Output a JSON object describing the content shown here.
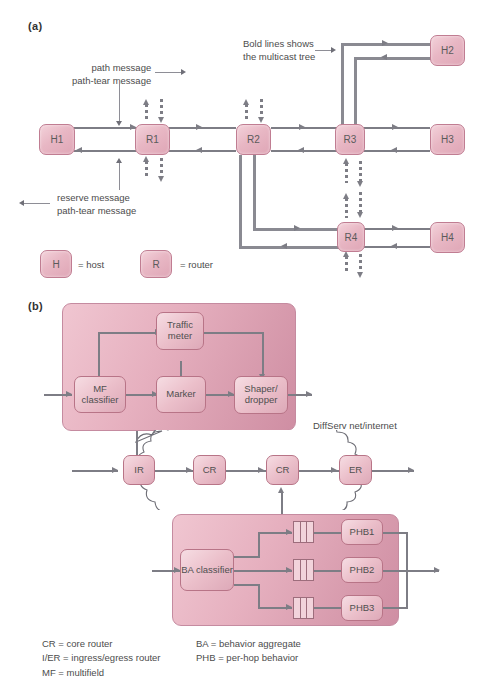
{
  "figure": {
    "panel_a_label": "(a)",
    "panel_b_label": "(b)"
  },
  "panel_a": {
    "nodes": [
      {
        "id": "H1",
        "label": "H1"
      },
      {
        "id": "R1",
        "label": "R1"
      },
      {
        "id": "R2",
        "label": "R2"
      },
      {
        "id": "R3",
        "label": "R3"
      },
      {
        "id": "R4",
        "label": "R4"
      },
      {
        "id": "H2",
        "label": "H2"
      },
      {
        "id": "H3",
        "label": "H3"
      },
      {
        "id": "H4",
        "label": "H4"
      }
    ],
    "annotations": {
      "forward_line1": "path message",
      "forward_line2": "path-tear message",
      "reverse_line1": "reserve message",
      "reverse_line2": "path-tear message",
      "multicast_line1": "Bold lines shows",
      "multicast_line2": "the multicast tree"
    },
    "key": {
      "host_symbol": "H",
      "host_text": "= host",
      "router_symbol": "R",
      "router_text": "= router"
    }
  },
  "panel_b": {
    "edge_router": {
      "mf_line1": "MF",
      "mf_line2": "classifier",
      "meter_line1": "Traffic",
      "meter_line2": "meter",
      "marker": "Marker",
      "shaper_line1": "Shaper/",
      "shaper_line2": "dropper"
    },
    "cloud": {
      "caption": "DiffServ net/internet",
      "routers": [
        "IR",
        "CR",
        "CR",
        "ER"
      ]
    },
    "core_router": {
      "ba_line1": "BA",
      "ba_line2": "classifier",
      "phbs": [
        "PHB1",
        "PHB2",
        "PHB3"
      ]
    }
  },
  "legend": {
    "left": "CR = core router\nI/ER = ingress/egress router\nMF = multifield",
    "right": "BA = behavior aggregate\nPHB = per-hop behavior"
  },
  "colors": {
    "node_fill": "#e8b7c4",
    "node_border": "#c07d92",
    "panel_fill": "#e0a7b8",
    "line": "#7d7d85",
    "text": "#4a4a4a"
  }
}
